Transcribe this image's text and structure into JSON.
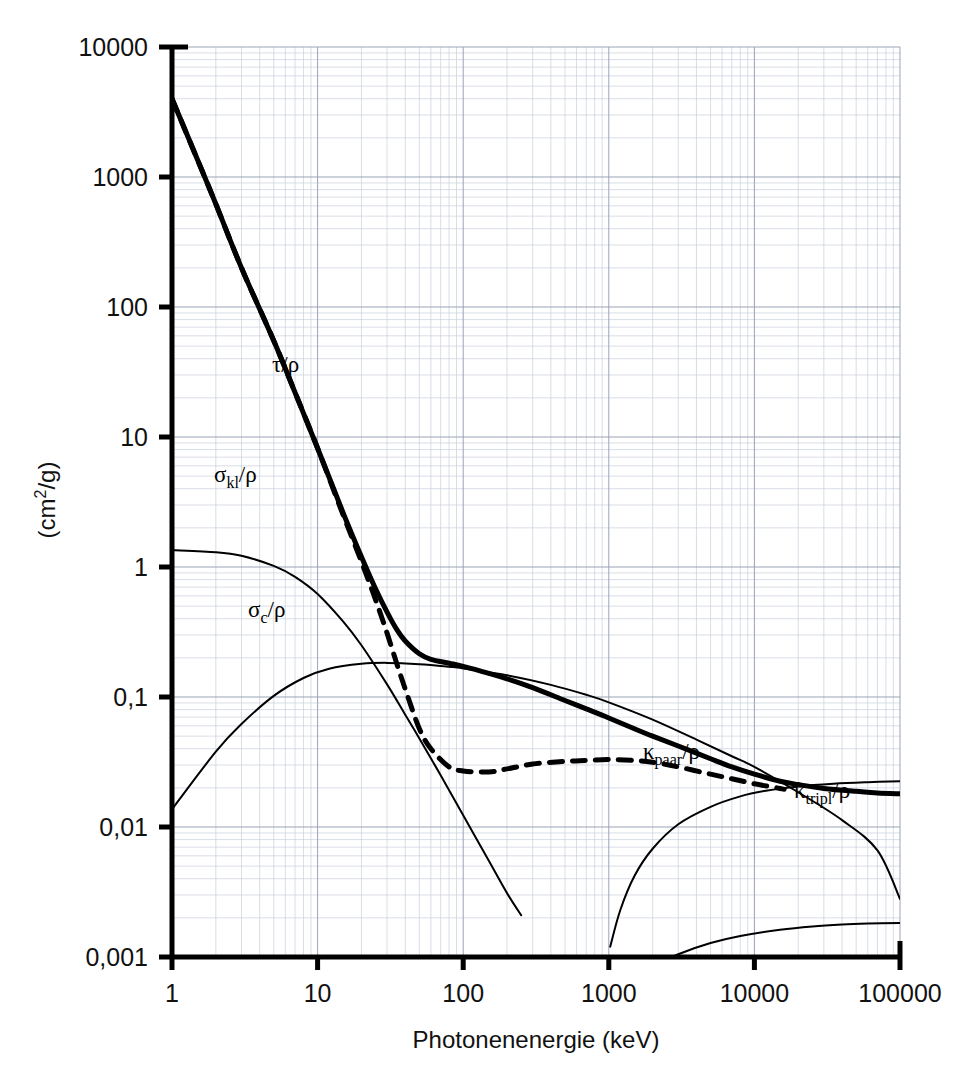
{
  "figure": {
    "background": "#ffffff",
    "plot_area": {
      "x0": 172,
      "x1": 900,
      "y_top": 47,
      "y_bottom": 957
    },
    "axis_color": "#000000",
    "grid_major_color": "#9aa3b5",
    "grid_minor_color": "#c9cfdd"
  },
  "axes": {
    "x": {
      "title": "Photonenenergie (keV)",
      "scale": "log",
      "min": 1,
      "max": 100000,
      "tick_labels": [
        "1",
        "10",
        "100",
        "1000",
        "10000",
        "100000"
      ],
      "tick_values": [
        1,
        10,
        100,
        1000,
        10000,
        100000
      ]
    },
    "y": {
      "title": "(cm2/g)",
      "title_parts": {
        "pre": "(cm",
        "sup": "2",
        "post": "/g)"
      },
      "scale": "log",
      "min": 0.001,
      "max": 10000,
      "tick_labels": [
        "10000",
        "1000",
        "100",
        "10",
        "1",
        "0,1",
        "0,01",
        "0,001"
      ],
      "tick_values": [
        10000,
        1000,
        100,
        10,
        1,
        0.1,
        0.01,
        0.001
      ]
    }
  },
  "curve_labels": [
    {
      "name": "tau-rho",
      "base": "τ",
      "sub": "",
      "tail": "/ρ",
      "x": 272,
      "y": 372
    },
    {
      "name": "sigma-kl-rho",
      "base": "σ",
      "sub": "kl",
      "tail": "/ρ",
      "x": 214,
      "y": 482
    },
    {
      "name": "sigma-c-rho",
      "base": "σ",
      "sub": "c",
      "tail": "/ρ",
      "x": 248,
      "y": 617
    },
    {
      "name": "kappa-paar-rho",
      "base": "κ",
      "sub": "paar",
      "tail": "/ρ",
      "x": 643,
      "y": 759
    },
    {
      "name": "kappa-tripl-rho",
      "base": "κ",
      "sub": "tripl",
      "tail": "/ρ",
      "x": 794,
      "y": 798
    }
  ],
  "chart_data": {
    "type": "line",
    "title": "",
    "xlabel": "Photonenenergie (keV)",
    "ylabel": "(cm2/g)",
    "xscale": "log",
    "yscale": "log",
    "xlim": [
      1,
      100000
    ],
    "ylim": [
      0.001,
      10000
    ],
    "grid": true,
    "legend": "inline-annotations",
    "series": [
      {
        "name": "mu/rho total",
        "label": "",
        "style": "solid-thick",
        "linewidth": 5,
        "color": "#000000",
        "x": [
          1,
          1.5,
          2,
          3,
          5,
          7,
          10,
          15,
          20,
          25,
          30,
          35,
          40,
          50,
          60,
          80,
          100,
          150,
          200,
          300,
          500,
          700,
          1000,
          1500,
          2000,
          3000,
          5000,
          7000,
          10000,
          15000,
          20000,
          30000,
          50000,
          70000,
          100000
        ],
        "y": [
          4000,
          1350,
          620,
          200,
          55,
          22,
          8.2,
          2.6,
          1.2,
          0.68,
          0.45,
          0.33,
          0.27,
          0.215,
          0.195,
          0.182,
          0.172,
          0.152,
          0.138,
          0.118,
          0.094,
          0.081,
          0.069,
          0.057,
          0.05,
          0.042,
          0.0335,
          0.029,
          0.0255,
          0.0225,
          0.0212,
          0.0198,
          0.0188,
          0.0183,
          0.018
        ]
      },
      {
        "name": "tau/rho photoelectric",
        "label": "τ/ρ",
        "style": "dashed",
        "linewidth": 5,
        "color": "#000000",
        "x": [
          1,
          1.5,
          2,
          3,
          5,
          7,
          10,
          15,
          20,
          25,
          30,
          35,
          40,
          50,
          60,
          80,
          100,
          150,
          200,
          300,
          500,
          700,
          1000,
          1500,
          2000,
          3000,
          5000,
          7000,
          10000,
          15000,
          16000
        ],
        "y": [
          4000,
          1350,
          620,
          200,
          55,
          22,
          8.2,
          2.5,
          1.1,
          0.56,
          0.31,
          0.18,
          0.115,
          0.057,
          0.04,
          0.029,
          0.027,
          0.0265,
          0.028,
          0.0305,
          0.032,
          0.0325,
          0.033,
          0.0325,
          0.0315,
          0.029,
          0.0255,
          0.0235,
          0.0215,
          0.0198,
          0.0195
        ]
      },
      {
        "name": "sigma_kl/rho coherent",
        "label": "σkl/ρ",
        "style": "solid-thin",
        "linewidth": 2,
        "color": "#000000",
        "x": [
          1,
          2,
          3,
          5,
          7,
          10,
          15,
          20,
          30,
          40,
          50,
          70,
          100,
          150,
          200,
          250
        ],
        "y": [
          1.35,
          1.3,
          1.22,
          1.02,
          0.84,
          0.62,
          0.38,
          0.25,
          0.125,
          0.073,
          0.048,
          0.025,
          0.0123,
          0.0055,
          0.0031,
          0.0021
        ]
      },
      {
        "name": "sigma_c/rho Compton",
        "label": "σc/ρ",
        "style": "solid-thin",
        "linewidth": 2,
        "color": "#000000",
        "x": [
          1,
          2,
          3,
          5,
          8,
          12,
          20,
          30,
          50,
          80,
          100,
          200,
          400,
          700,
          1000,
          2000,
          4000,
          7000,
          10000,
          20000,
          40000,
          70000,
          100000
        ],
        "y": [
          0.0137,
          0.038,
          0.062,
          0.102,
          0.14,
          0.165,
          0.18,
          0.183,
          0.179,
          0.171,
          0.166,
          0.147,
          0.124,
          0.104,
          0.091,
          0.067,
          0.047,
          0.035,
          0.029,
          0.0185,
          0.0113,
          0.0066,
          0.0028
        ]
      },
      {
        "name": "kappa_paar/rho pair production",
        "label": "κpaar/ρ",
        "style": "solid-thin",
        "linewidth": 2,
        "color": "#000000",
        "x": [
          1022,
          1200,
          1500,
          2000,
          3000,
          5000,
          8000,
          12000,
          20000,
          35000,
          60000,
          100000
        ],
        "y": [
          0.0012,
          0.0023,
          0.0042,
          0.0068,
          0.0105,
          0.0143,
          0.0172,
          0.019,
          0.0205,
          0.0215,
          0.0221,
          0.0225
        ]
      },
      {
        "name": "kappa_tripl/rho triplet production",
        "label": "κtripl/ρ",
        "style": "solid-thin",
        "linewidth": 2,
        "color": "#000000",
        "x": [
          2044,
          3000,
          5000,
          8000,
          15000,
          25000,
          40000,
          60000,
          100000
        ],
        "y": [
          0.00085,
          0.00105,
          0.00128,
          0.00145,
          0.00162,
          0.00172,
          0.00178,
          0.00181,
          0.00183
        ]
      }
    ]
  }
}
